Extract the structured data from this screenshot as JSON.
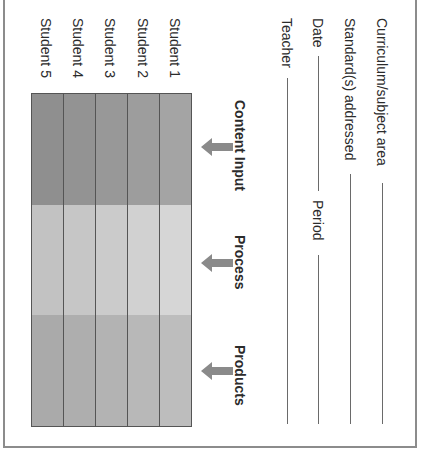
{
  "form": {
    "fields": [
      {
        "label": "Curriculum/subject area"
      },
      {
        "label": "Standard(s) addressed"
      },
      {
        "label": "Date",
        "second_label": "Period"
      },
      {
        "label": "Teacher"
      }
    ]
  },
  "grid": {
    "headers": [
      "Content Input",
      "Process",
      "Products"
    ],
    "students": [
      "Student 1",
      "Student 2",
      "Student 3",
      "Student 4",
      "Student 5"
    ],
    "row_colors": {
      "content_input": [
        "#a4a4a4",
        "#9d9d9d",
        "#989898",
        "#939393",
        "#8f8f8f"
      ],
      "process": [
        "#d6d6d6",
        "#d1d1d1",
        "#cbcbcb",
        "#c6c6c6",
        "#c2c2c2"
      ],
      "products": [
        "#bdbdbd",
        "#b8b8b8",
        "#b3b3b3",
        "#aeaeae",
        "#aaaaaa"
      ]
    }
  },
  "colors": {
    "arrow": "#8a8a8a",
    "border": "#8c8c8c",
    "text": "#2b2b2b"
  }
}
